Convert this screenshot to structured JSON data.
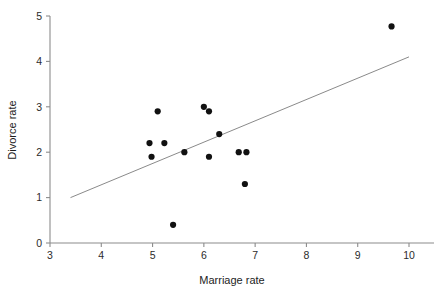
{
  "chart_data": {
    "type": "scatter",
    "title": "",
    "xlabel": "Marriage rate",
    "ylabel": "Divorce rate",
    "xlim": [
      3,
      10
    ],
    "ylim": [
      0,
      5
    ],
    "xticks": [
      "3",
      "4",
      "5",
      "6",
      "7",
      "8",
      "9",
      "10"
    ],
    "yticks": [
      "0",
      "1",
      "2",
      "3",
      "4",
      "5"
    ],
    "grid": false,
    "legend": "none",
    "point_color": "#111111",
    "line_color": "#8a8a8a",
    "axis_color": "#8c8c8c",
    "points": [
      {
        "x": 4.94,
        "y": 2.2
      },
      {
        "x": 4.98,
        "y": 1.9
      },
      {
        "x": 5.1,
        "y": 2.9
      },
      {
        "x": 5.23,
        "y": 2.2
      },
      {
        "x": 5.4,
        "y": 0.4
      },
      {
        "x": 5.62,
        "y": 2.0
      },
      {
        "x": 6.0,
        "y": 3.0
      },
      {
        "x": 6.1,
        "y": 2.9
      },
      {
        "x": 6.1,
        "y": 1.9
      },
      {
        "x": 6.3,
        "y": 2.4
      },
      {
        "x": 6.68,
        "y": 2.0
      },
      {
        "x": 6.83,
        "y": 2.0
      },
      {
        "x": 6.8,
        "y": 1.3
      },
      {
        "x": 9.66,
        "y": 4.77
      }
    ],
    "trend_line": {
      "x_start": 3.4,
      "y_start": 1.0,
      "x_end": 10.0,
      "y_end": 4.1
    }
  }
}
